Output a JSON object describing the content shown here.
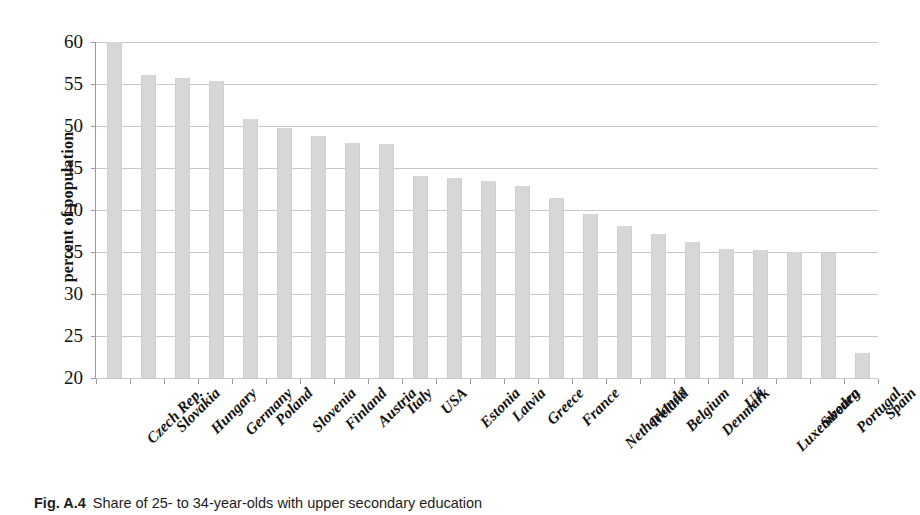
{
  "chart_data": {
    "type": "bar",
    "title": "",
    "xlabel": "",
    "ylabel": "percent of population",
    "ylim": [
      20,
      60
    ],
    "yticks": [
      20,
      25,
      30,
      35,
      40,
      45,
      50,
      55,
      60
    ],
    "grid": true,
    "legend": "none",
    "bar_color": "#d7d7d7",
    "categories": [
      "Czech Rep.",
      "Slovakia",
      "Hungary",
      "Germany",
      "Poland",
      "Slovenia",
      "Finland",
      "Austria",
      "Italy",
      "USA",
      "Estonia",
      "Latvia",
      "Greece",
      "France",
      "Netherlands",
      "Ireland",
      "Belgium",
      "Denmark",
      "UK",
      "Luxembourg",
      "Sweden",
      "Portugal",
      "Spain"
    ],
    "values": [
      60.0,
      56.1,
      55.7,
      55.4,
      50.8,
      49.8,
      48.8,
      48.0,
      47.8,
      44.0,
      43.8,
      43.4,
      42.8,
      41.4,
      39.5,
      38.1,
      37.2,
      36.2,
      35.3,
      35.2,
      35.0,
      34.9,
      23.0
    ]
  },
  "caption": {
    "figure_number": "Fig. A.4",
    "text": "Share of 25- to 34-year-olds with upper secondary education"
  }
}
